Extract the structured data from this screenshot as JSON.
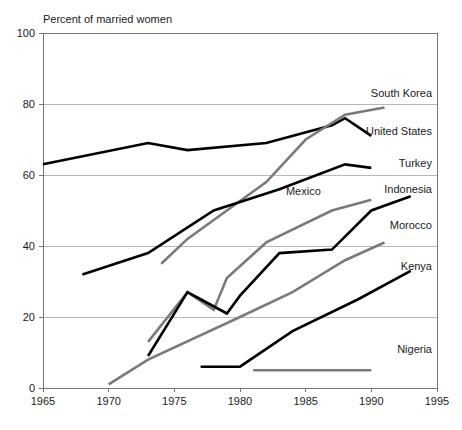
{
  "chart_data": {
    "type": "line",
    "title": "Percent of married women",
    "xlabel": "",
    "ylabel": "",
    "xlim": [
      1965,
      1995
    ],
    "ylim": [
      0,
      100
    ],
    "grid": true,
    "legend_position": "right-inline-labels",
    "x_ticks": [
      1965,
      1970,
      1975,
      1980,
      1985,
      1990,
      1995
    ],
    "y_ticks": [
      0,
      20,
      40,
      60,
      80,
      100
    ],
    "series": [
      {
        "name": "United States",
        "color": "#000000",
        "label_x": 1991.0,
        "label_y": 72.5,
        "x": [
          1965,
          1973,
          1976,
          1982,
          1987,
          1988,
          1990
        ],
        "values": [
          63,
          69,
          67,
          69,
          74,
          76,
          71
        ]
      },
      {
        "name": "South Korea",
        "color": "#7a7a7a",
        "label_x": 1991.0,
        "label_y": 83.0,
        "x": [
          1974,
          1976,
          1979,
          1982,
          1985,
          1988,
          1991
        ],
        "values": [
          35,
          42,
          50,
          58,
          70,
          77,
          79
        ]
      },
      {
        "name": "Turkey",
        "color": "#000000",
        "label_x": 1991.0,
        "label_y": 63.5,
        "x": [
          1968,
          1973,
          1978,
          1983,
          1988,
          1990
        ],
        "values": [
          32,
          38,
          50,
          56,
          63,
          62
        ]
      },
      {
        "name": "Mexico",
        "color": "#7a7a7a",
        "label_x": 1983.5,
        "label_y": 55.5,
        "x": [
          1973,
          1976,
          1978,
          1979,
          1982,
          1987,
          1990
        ],
        "values": [
          13,
          27,
          22,
          31,
          41,
          50,
          53
        ]
      },
      {
        "name": "Indonesia",
        "color": "#000000",
        "label_x": 1991.0,
        "label_y": 56.0,
        "x": [
          1973,
          1976,
          1977,
          1979,
          1980,
          1983,
          1987,
          1990,
          1993
        ],
        "values": [
          9,
          27,
          25,
          21,
          26,
          38,
          39,
          50,
          54
        ]
      },
      {
        "name": "Morocco",
        "color": "#7a7a7a",
        "label_x": 1991.0,
        "label_y": 46.0,
        "x": [
          1970,
          1973,
          1980,
          1984,
          1988,
          1991
        ],
        "values": [
          1,
          8,
          20,
          27,
          36,
          41
        ]
      },
      {
        "name": "Kenya",
        "color": "#000000",
        "label_x": 1991.0,
        "label_y": 34.5,
        "x": [
          1977,
          1980,
          1984,
          1989,
          1993
        ],
        "values": [
          6,
          6,
          16,
          25,
          33
        ]
      },
      {
        "name": "Nigeria",
        "color": "#7a7a7a",
        "label_x": 1991.0,
        "label_y": 11.0,
        "x": [
          1981,
          1985,
          1990
        ],
        "values": [
          5,
          5,
          5
        ]
      }
    ]
  },
  "axes": {
    "plot_left_px": 43,
    "plot_right_px": 437,
    "plot_top_px": 33,
    "plot_bottom_px": 388
  }
}
